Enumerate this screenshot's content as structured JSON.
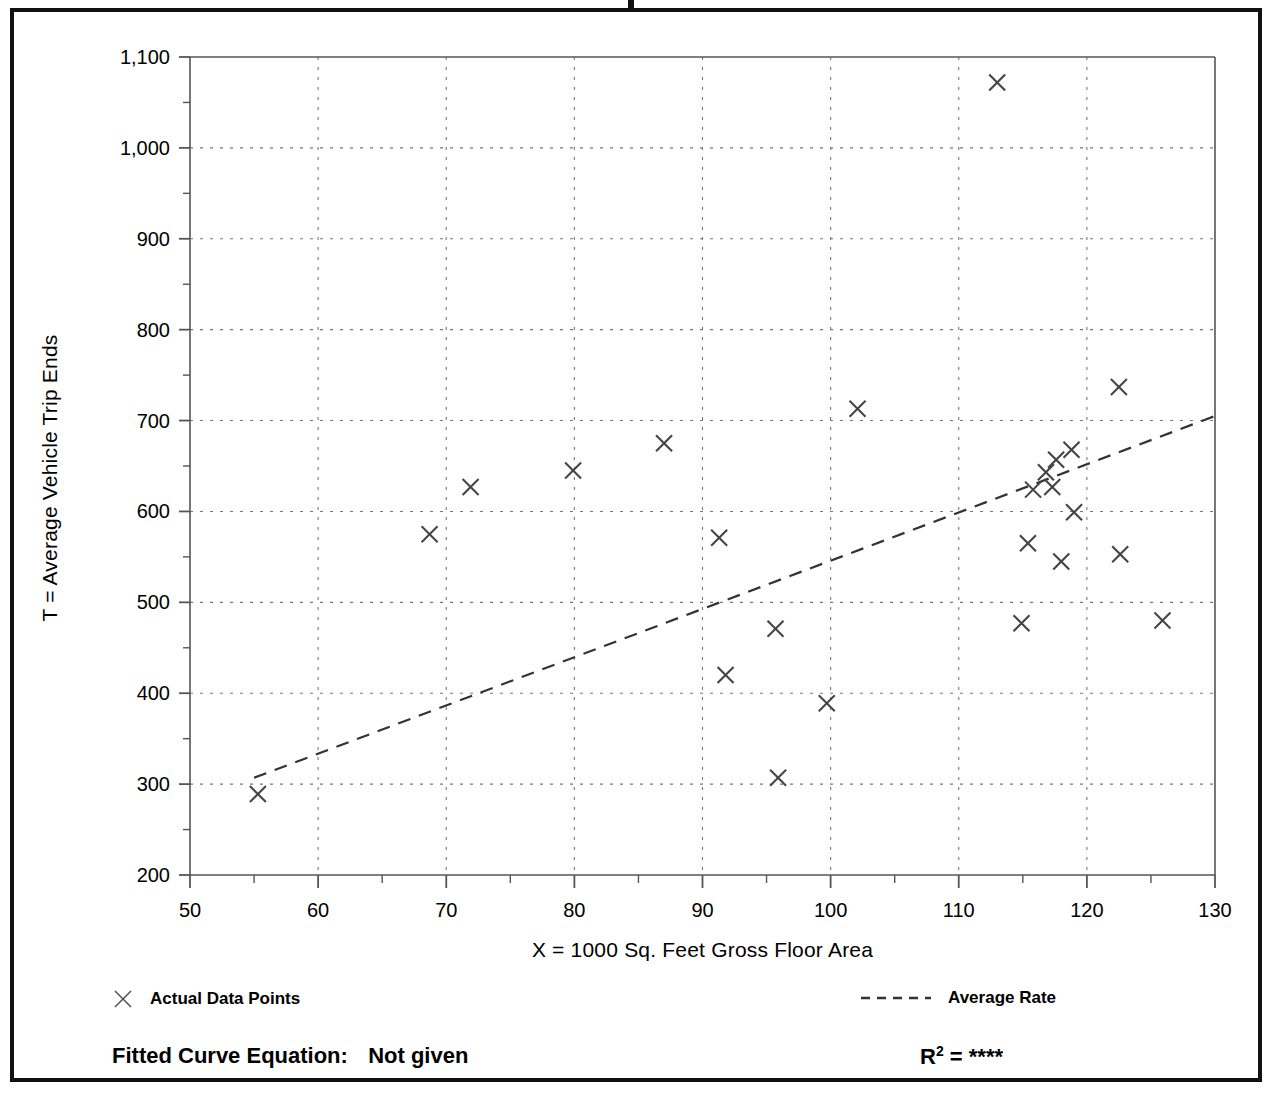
{
  "chart_data": {
    "type": "scatter",
    "title": "",
    "xlabel": "X = 1000 Sq. Feet Gross Floor Area",
    "ylabel": "T = Average Vehicle Trip Ends",
    "xlim": [
      50,
      130
    ],
    "ylim": [
      200,
      1100
    ],
    "x_ticks": [
      50,
      60,
      70,
      80,
      90,
      100,
      110,
      120,
      130
    ],
    "x_tick_labels": [
      "50",
      "60",
      "70",
      "80",
      "90",
      "100",
      "110",
      "120",
      "130"
    ],
    "x_minor_step": 5,
    "y_ticks": [
      200,
      300,
      400,
      500,
      600,
      700,
      800,
      900,
      1000,
      1100
    ],
    "y_tick_labels": [
      "200",
      "300",
      "400",
      "500",
      "600",
      "700",
      "800",
      "900",
      "1,000",
      "1,100"
    ],
    "y_minor_step": 50,
    "grid": true,
    "grid_style": "dotted",
    "legend_position": "below-plot",
    "series": [
      {
        "name": "Actual Data Points",
        "type": "scatter",
        "marker": "x",
        "color": "#444444",
        "points": [
          [
            55.3,
            289
          ],
          [
            68.7,
            575
          ],
          [
            71.9,
            627
          ],
          [
            79.9,
            645
          ],
          [
            87.0,
            675
          ],
          [
            91.3,
            571
          ],
          [
            91.8,
            420
          ],
          [
            95.7,
            471
          ],
          [
            95.9,
            307
          ],
          [
            99.7,
            389
          ],
          [
            102.1,
            713
          ],
          [
            113.0,
            1072
          ],
          [
            114.9,
            477
          ],
          [
            115.4,
            565
          ],
          [
            115.8,
            624
          ],
          [
            116.8,
            643
          ],
          [
            117.3,
            627
          ],
          [
            117.6,
            657
          ],
          [
            118.0,
            545
          ],
          [
            118.8,
            668
          ],
          [
            119.0,
            599
          ],
          [
            122.5,
            737
          ],
          [
            122.6,
            553
          ],
          [
            125.9,
            480
          ]
        ]
      },
      {
        "name": "Average Rate",
        "type": "line",
        "style": "dashed",
        "color": "#333333",
        "endpoints": [
          [
            55.0,
            307
          ],
          [
            130.0,
            705
          ]
        ]
      }
    ]
  },
  "axis_titles": {
    "x": "X = 1000 Sq. Feet Gross Floor Area",
    "y": "T = Average Vehicle Trip Ends"
  },
  "legend": {
    "data_points_label": "Actual Data Points",
    "average_rate_label": "Average Rate"
  },
  "footer": {
    "fitted_curve_label": "Fitted Curve Equation:",
    "fitted_curve_value": "Not given",
    "r_label": "R",
    "r_exponent": "2",
    "r_equals": "=",
    "r_value": "****"
  },
  "colors": {
    "frame": "#111111",
    "axis": "#555555",
    "grid": "#777777",
    "marker": "#444444",
    "trendline": "#333333"
  }
}
